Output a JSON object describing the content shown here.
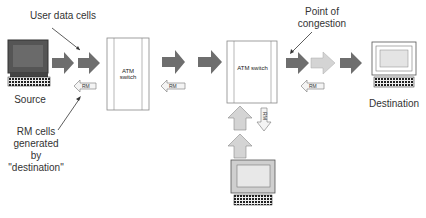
{
  "labels": {
    "user_data_cells": "User data cells",
    "source": "Source",
    "rm_cells_line1": "RM cells",
    "rm_cells_line2": "generated by",
    "rm_cells_line3": "\"destination\"",
    "point_line1": "Point of",
    "point_line2": "congestion",
    "destination": "Destination"
  },
  "switches": [
    {
      "label": "ATM switch"
    },
    {
      "label": "ATM switch"
    }
  ],
  "rm_tags": [
    "RM",
    "RM",
    "RM",
    "RM"
  ],
  "colors": {
    "dark_arrow": "#6e6e6e",
    "light_arrow": "#d4d4d4",
    "outline": "#888888",
    "text": "#333333"
  }
}
